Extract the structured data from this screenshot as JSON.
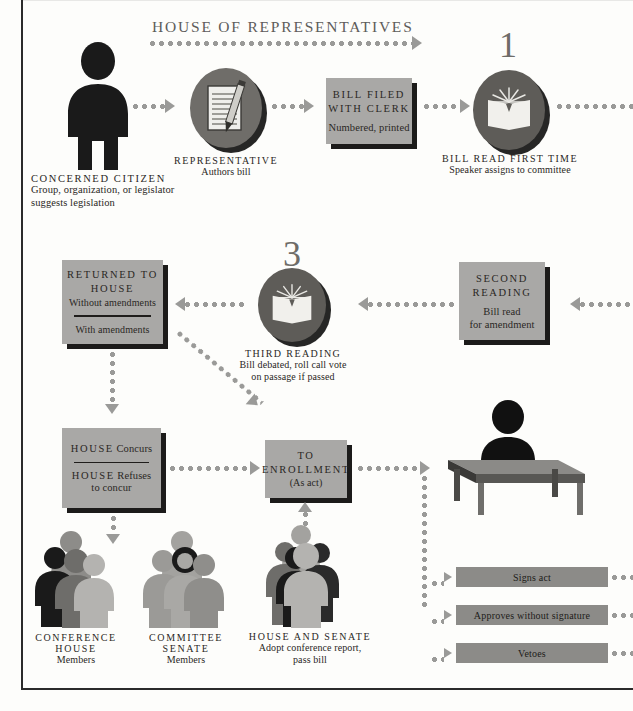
{
  "diagram": {
    "section_header": "HOUSE OF REPRESENTATIVES",
    "step_numbers": {
      "first_reading": "1",
      "third_reading": "3"
    }
  },
  "nodes": {
    "citizen": {
      "icon": "person-icon",
      "label": "CONCERNED CITIZEN",
      "detail_line1": "Group, organization, or legislator",
      "detail_line2": "suggests legislation"
    },
    "representative": {
      "icon": "notepad-pencil-icon",
      "label": "REPRESENTATIVE",
      "detail": "Authors bill"
    },
    "bill_filed": {
      "title_line1": "BILL FILED",
      "title_line2": "WITH CLERK",
      "detail": "Numbered, printed"
    },
    "first_reading": {
      "number": "1",
      "icon": "open-book-icon",
      "label": "BILL READ FIRST TIME",
      "detail": "Speaker assigns to committee"
    },
    "second_reading": {
      "title_line1": "SECOND",
      "title_line2": "READING",
      "detail_line1": "Bill read",
      "detail_line2": "for amendment"
    },
    "third_reading": {
      "number": "3",
      "icon": "open-book-icon",
      "label": "THIRD READING",
      "detail_line1": "Bill debated, roll call vote",
      "detail_line2": "on passage if passed"
    },
    "returned_to_house": {
      "title_line1": "RETURNED TO",
      "title_line2": "HOUSE",
      "option_a": "Without amendments",
      "option_b": "With amendments"
    },
    "house_concur": {
      "option_a_strong": "HOUSE",
      "option_a_rest": "Concurs",
      "option_b_strong": "HOUSE",
      "option_b_rest": "Refuses",
      "option_b_line2": "to concur"
    },
    "to_enrollment": {
      "title_line1": "TO",
      "title_line2": "ENROLLMENT",
      "detail": "(As act)"
    },
    "conference_house": {
      "icon": "people-group-icon",
      "label_line1": "CONFERENCE",
      "label_line2": "HOUSE",
      "label_line3": "Members"
    },
    "committee_senate": {
      "icon": "people-group-icon",
      "label_line1": "COMMITTEE",
      "label_line2": "SENATE",
      "label_line3": "Members"
    },
    "house_and_senate": {
      "icon": "people-group-icon",
      "label_line1": "HOUSE AND SENATE",
      "label_line2": "Adopt conference report,",
      "label_line3": "pass bill"
    },
    "governor": {
      "icon": "person-at-desk-icon",
      "label": "TO GOVERNOR",
      "actions": [
        {
          "label": "Signs act"
        },
        {
          "label": "Approves without signature"
        },
        {
          "label": "Vetoes"
        }
      ]
    }
  },
  "colors": {
    "plaque_fill": "#a9a8a6",
    "plaque_shadow": "#1c1b1a",
    "medallion_fill": "#6f6d69",
    "governor_bar_fill": "#8c8b88",
    "connector": "#9a9a98",
    "section_header": "#5d5c5a",
    "figure_dark": "#1a1a1a",
    "figure_mid": "#7d7c79",
    "figure_light": "#b4b3b0",
    "text": "#2a2724"
  }
}
